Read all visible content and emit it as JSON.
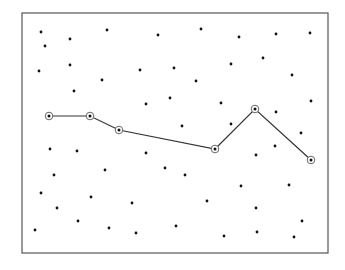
{
  "diagram": {
    "type": "scatter-with-path",
    "frame": {
      "x": 22,
      "y": 13,
      "width": 306,
      "height": 240,
      "stroke": "#555555"
    },
    "colors": {
      "dot": "#111111",
      "path": "#333333",
      "marker_ring": "#666666"
    },
    "points": [
      [
        41,
        32
      ],
      [
        45,
        46
      ],
      [
        70,
        39
      ],
      [
        107,
        30
      ],
      [
        158,
        35
      ],
      [
        201,
        29
      ],
      [
        239,
        37
      ],
      [
        276,
        34
      ],
      [
        310,
        33
      ],
      [
        39,
        71
      ],
      [
        70,
        65
      ],
      [
        102,
        80
      ],
      [
        140,
        70
      ],
      [
        174,
        68
      ],
      [
        196,
        81
      ],
      [
        231,
        64
      ],
      [
        263,
        58
      ],
      [
        292,
        75
      ],
      [
        74,
        91
      ],
      [
        146,
        104
      ],
      [
        170,
        98
      ],
      [
        221,
        103
      ],
      [
        311,
        101
      ],
      [
        276,
        112
      ],
      [
        182,
        126
      ],
      [
        231,
        124
      ],
      [
        301,
        133
      ],
      [
        50,
        149
      ],
      [
        77,
        151
      ],
      [
        146,
        153
      ],
      [
        275,
        146
      ],
      [
        256,
        155
      ],
      [
        54,
        175
      ],
      [
        105,
        170
      ],
      [
        165,
        168
      ],
      [
        185,
        175
      ],
      [
        241,
        186
      ],
      [
        289,
        185
      ],
      [
        41,
        193
      ],
      [
        91,
        197
      ],
      [
        132,
        203
      ],
      [
        207,
        201
      ],
      [
        57,
        208
      ],
      [
        256,
        208
      ],
      [
        78,
        221
      ],
      [
        302,
        221
      ],
      [
        35,
        230
      ],
      [
        109,
        228
      ],
      [
        176,
        226
      ],
      [
        136,
        233
      ],
      [
        224,
        236
      ],
      [
        257,
        232
      ],
      [
        294,
        237
      ]
    ],
    "path": [
      [
        49,
        116
      ],
      [
        90,
        116
      ],
      [
        119,
        130
      ],
      [
        215,
        149
      ],
      [
        255,
        109
      ],
      [
        311,
        160
      ]
    ]
  }
}
